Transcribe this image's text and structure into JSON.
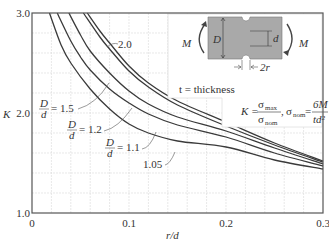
{
  "chart_data": {
    "type": "line",
    "title": "",
    "xlabel": "r/d",
    "ylabel": "K",
    "xlim": [
      0,
      0.3
    ],
    "ylim": [
      1.0,
      3.0
    ],
    "x_ticks": [
      {
        "value": 0,
        "label": "0"
      },
      {
        "value": 0.1,
        "label": "0.1"
      },
      {
        "value": 0.2,
        "label": "0.2"
      },
      {
        "value": 0.3,
        "label": "0.3"
      }
    ],
    "y_ticks": [
      {
        "value": 1.0,
        "label": "1.0"
      },
      {
        "value": 2.0,
        "label": "2.0"
      },
      {
        "value": 3.0,
        "label": "3.0"
      }
    ],
    "grid": {
      "on": true,
      "x_step": 0.02,
      "y_step": 0.2
    },
    "x": [
      0.017,
      0.025,
      0.04,
      0.06,
      0.08,
      0.1,
      0.12,
      0.15,
      0.2,
      0.25,
      0.3
    ],
    "series": [
      {
        "name": "D/d = 2.0",
        "label": "2.0",
        "x": [
          0.057,
          0.07,
          0.08,
          0.1,
          0.12,
          0.15,
          0.2,
          0.25,
          0.3
        ],
        "values": [
          3.0,
          2.82,
          2.7,
          2.47,
          2.3,
          2.12,
          1.91,
          1.7,
          1.52
        ]
      },
      {
        "name": "D/d = 1.5",
        "label": "1.5",
        "x": [
          0.053,
          0.07,
          0.08,
          0.1,
          0.12,
          0.15,
          0.2,
          0.25,
          0.3
        ],
        "values": [
          3.0,
          2.76,
          2.64,
          2.42,
          2.26,
          2.08,
          1.87,
          1.68,
          1.51
        ]
      },
      {
        "name": "D/d = 1.2",
        "label": "1.2",
        "x": [
          0.038,
          0.05,
          0.06,
          0.08,
          0.1,
          0.12,
          0.15,
          0.2,
          0.25,
          0.3
        ],
        "values": [
          3.0,
          2.78,
          2.62,
          2.4,
          2.22,
          2.09,
          1.96,
          1.82,
          1.65,
          1.49
        ]
      },
      {
        "name": "D/d = 1.1",
        "label": "1.1",
        "x": [
          0.026,
          0.04,
          0.05,
          0.06,
          0.08,
          0.1,
          0.12,
          0.15,
          0.2,
          0.25,
          0.3
        ],
        "values": [
          3.0,
          2.72,
          2.56,
          2.43,
          2.24,
          2.1,
          1.99,
          1.88,
          1.76,
          1.6,
          1.47
        ]
      },
      {
        "name": "D/d = 1.05",
        "label": "1.05",
        "x": [
          0.018,
          0.03,
          0.04,
          0.06,
          0.08,
          0.1,
          0.12,
          0.15,
          0.2,
          0.25,
          0.3
        ],
        "values": [
          3.0,
          2.68,
          2.5,
          2.24,
          2.04,
          1.89,
          1.8,
          1.72,
          1.66,
          1.53,
          1.44
        ]
      }
    ],
    "annotations": [
      {
        "text": "2.0",
        "series": "D/d = 2.0"
      },
      {
        "text": "D/d = 1.5",
        "series": "D/d = 1.5"
      },
      {
        "text": "D/d = 1.2",
        "series": "D/d = 1.2"
      },
      {
        "text": "D/d = 1.1",
        "series": "D/d = 1.1"
      },
      {
        "text": "1.05",
        "series": "D/d = 1.05"
      }
    ],
    "legend": {
      "position": "none"
    }
  },
  "inset": {
    "moment_left": "M",
    "moment_right": "M",
    "dim_D": "D",
    "dim_d": "d",
    "dim_2r": "2r",
    "thickness_note": "t = thickness",
    "formula_K": "K =",
    "sigma_max": "σ",
    "sigma_max_sub": "max",
    "sigma_nom": "σ",
    "sigma_nom_sub": "nom",
    "formula_sep": ",",
    "formula_nom_lhs": "σ",
    "formula_nom_lhs_sub": "nom",
    "formula_eq": "=",
    "formula_num": "6M",
    "formula_den": "td²"
  },
  "labels": {
    "y_axis": "K",
    "x_axis": "r/d",
    "curve_2_0": "2.0",
    "frac_D": "D",
    "frac_d": "d",
    "eq_1_5": "= 1.5",
    "eq_1_2": "= 1.2",
    "eq_1_1": "= 1.1",
    "curve_1_05": "1.05"
  },
  "colors": {
    "curve": "#3a3a3a",
    "grid": "#d8d8d8",
    "axis": "#555555",
    "part_fill": "#a8a8a8",
    "leader": "#555555"
  }
}
